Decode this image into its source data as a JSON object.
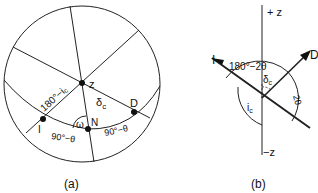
{
  "panel_a": {
    "caption": "(a)",
    "points": {
      "Z": "z",
      "N": "N",
      "I": "I",
      "D": "D"
    },
    "labels": {
      "arc_I_Z": "180°−i",
      "arc_I_Z_sub": "c",
      "arc_Z_D": "δ",
      "arc_Z_D_sub": "c",
      "angle_at_N": "ω",
      "arc_I_N": "90°−θ",
      "arc_N_D": "90°−θ"
    }
  },
  "panel_b": {
    "caption": "(b)",
    "axis_top": "+ z",
    "axis_bottom": "−z",
    "incident": "I",
    "diffracted": "D",
    "labels": {
      "arc_top": "180°−2θ",
      "delta": "δ",
      "delta_sub": "c",
      "i": "i",
      "i_sub": "c",
      "two_theta": "2θ"
    }
  },
  "colors": {
    "ink": "#111111",
    "background": "#ffffff"
  }
}
